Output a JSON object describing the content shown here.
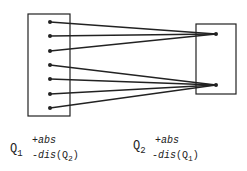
{
  "diagram": {
    "colors": {
      "line": "#222222",
      "background": "#ffffff"
    },
    "left_box": {
      "x": 28,
      "y": 14,
      "width": 42,
      "height": 102,
      "dots": [
        22,
        36,
        51,
        65,
        79,
        94,
        108
      ],
      "dot_x": 50
    },
    "right_box": {
      "x": 196,
      "y": 24,
      "width": 40,
      "height": 70,
      "dots": [
        34,
        85
      ],
      "dot_x": 216
    },
    "connections": [
      {
        "from": 0,
        "to": 0
      },
      {
        "from": 1,
        "to": 0
      },
      {
        "from": 2,
        "to": 0
      },
      {
        "from": 3,
        "to": 1
      },
      {
        "from": 4,
        "to": 1
      },
      {
        "from": 5,
        "to": 1
      },
      {
        "from": 6,
        "to": 1
      }
    ]
  },
  "labels": {
    "q1": {
      "name": "Q",
      "sub": "1",
      "plus": "+abs",
      "minus_prefix": "-",
      "minus_term": "dis",
      "minus_arg_open": "(Q",
      "minus_arg_sub": "2",
      "minus_arg_close": ")"
    },
    "q2": {
      "name": "Q",
      "sub": "2",
      "plus": "+abs",
      "minus_prefix": "-",
      "minus_term": "dis",
      "minus_arg_open": "(Q",
      "minus_arg_sub": "1",
      "minus_arg_close": ")"
    }
  }
}
